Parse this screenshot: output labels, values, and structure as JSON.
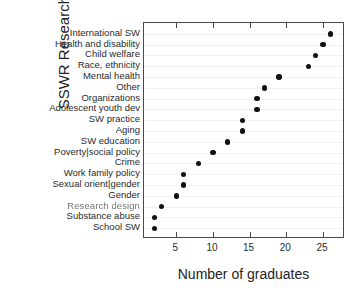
{
  "chart_data": {
    "type": "scatter",
    "title": "",
    "xlabel": "Number of graduates",
    "ylabel": "SSWR Research topics",
    "xlim": [
      0.6,
      28
    ],
    "ylim": [
      0,
      20
    ],
    "grid": true,
    "legend": "none",
    "orientation": "horizontal-dotplot",
    "xticks": [
      5,
      10,
      15,
      20,
      25
    ],
    "categories": [
      "International SW",
      "Health and disability",
      "Child welfare",
      "Race, ethnicity",
      "Mental health",
      "Other",
      "Organizations",
      "Adolescent youth dev",
      "SW practice",
      "Aging",
      "SW education",
      "Poverty|social policy",
      "Crime",
      "Work family policy",
      "Sexual orient|gender",
      "Gender",
      "Research design",
      "Substance abuse",
      "School SW"
    ],
    "values": [
      26,
      25,
      24,
      23,
      19,
      17,
      16,
      16,
      14,
      14,
      12,
      10,
      8,
      6,
      6,
      5,
      3,
      2,
      2
    ],
    "marker": {
      "shape": "circle",
      "color": "#111111",
      "size": 5.4
    },
    "frame_color": "#4a4a4a",
    "background": "#ffffff"
  }
}
